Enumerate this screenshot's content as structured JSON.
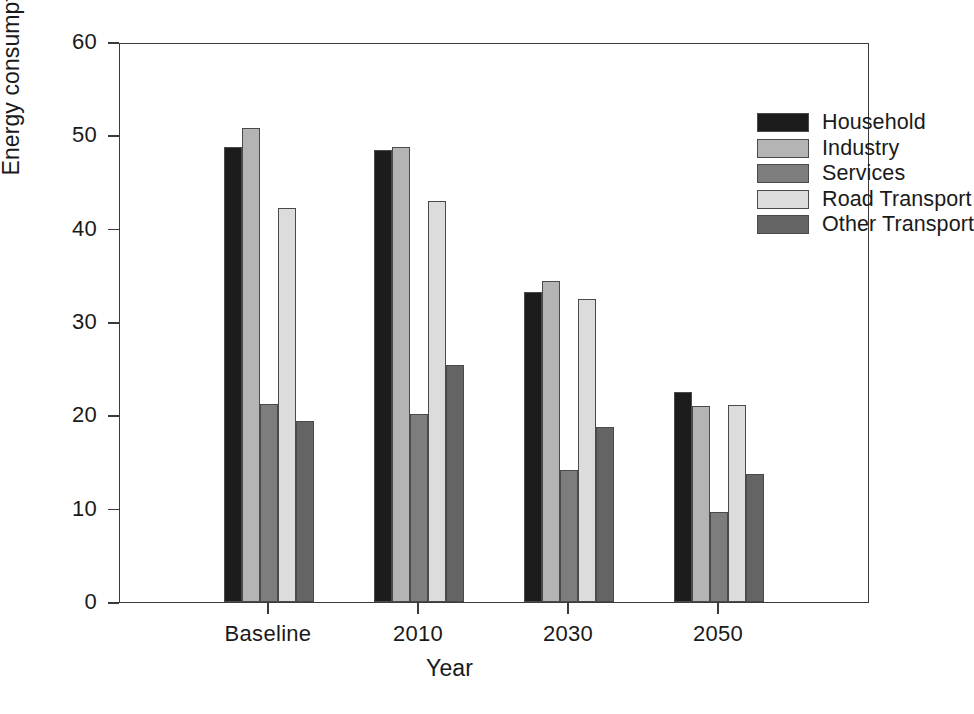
{
  "chart_data": {
    "type": "bar",
    "title": "",
    "xlabel": "Year",
    "ylabel": "Energy consumption (Mtoe)",
    "categories": [
      "Baseline",
      "2010",
      "2030",
      "2050"
    ],
    "ylim": [
      0,
      60
    ],
    "yticks": [
      0,
      10,
      20,
      30,
      40,
      50,
      60
    ],
    "ytick_labels": [
      "0",
      "10",
      "20",
      "30",
      "40",
      "50",
      "60"
    ],
    "grid": false,
    "legend_position": "top-right",
    "series": [
      {
        "name": "Household",
        "color": "#1c1c1c",
        "values": [
          48.7,
          48.4,
          33.2,
          22.5
        ]
      },
      {
        "name": "Industry",
        "color": "#b4b4b4",
        "values": [
          50.8,
          48.8,
          34.4,
          21.0
        ]
      },
      {
        "name": "Services",
        "color": "#7d7d7d",
        "values": [
          21.2,
          20.1,
          14.1,
          9.6
        ]
      },
      {
        "name": "Road Transport",
        "color": "#dcdcdc",
        "values": [
          42.2,
          43.0,
          32.5,
          21.1
        ]
      },
      {
        "name": "Other Transport",
        "color": "#646464",
        "values": [
          19.4,
          25.4,
          18.8,
          13.7
        ]
      }
    ]
  }
}
